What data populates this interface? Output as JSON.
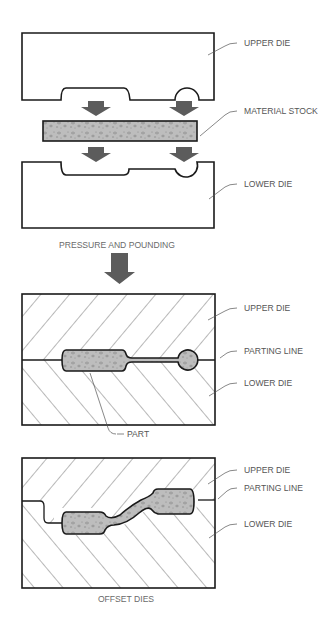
{
  "diagram": {
    "panels": [
      {
        "id": "separated-dies",
        "labels": {
          "upper_die": "UPPER DIE",
          "material_stock": "MATERIAL STOCK",
          "lower_die": "LOWER DIE"
        },
        "caption": "PRESSURE AND POUNDING"
      },
      {
        "id": "closed-dies",
        "labels": {
          "upper_die": "UPPER DIE",
          "parting_line": "PARTING LINE",
          "lower_die": "LOWER DIE",
          "part": "PART"
        }
      },
      {
        "id": "offset-dies",
        "labels": {
          "upper_die": "UPPER DIE",
          "parting_line": "PARTING LINE",
          "lower_die": "LOWER DIE"
        },
        "caption": "OFFSET DIES"
      }
    ],
    "colors": {
      "outline": "#1a1a1a",
      "arrow": "#5c5c5c",
      "stock_fill": "#b8b8b8",
      "label_text": "#555555"
    }
  }
}
